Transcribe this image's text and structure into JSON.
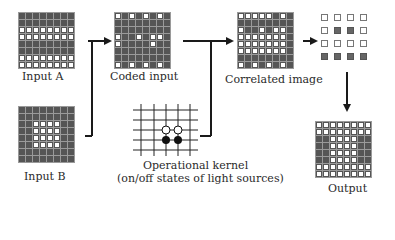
{
  "labels": {
    "input_a": "Input A",
    "input_b": "Input B",
    "coded_input": "Coded input",
    "correlated_image": "Correlated image",
    "operational_kernel_line1": "Operational kernel",
    "operational_kernel_line2": "(on/off states of light sources)",
    "output": "Output"
  },
  "grids": {
    "input_a": [
      "DDDDDDDD",
      "DDDDDDDD",
      "WWWWWWWW",
      "WWWWWWWW",
      "DDDDDDDD",
      "DDDDDDDD",
      "WWWWWWWW",
      "WWWWWWWW"
    ],
    "input_b": [
      "DDDDDDDD",
      "DDDDDDDD",
      "DDWWWWDD",
      "DDWWWWDD",
      "DDWWWWDD",
      "DDWWWWDD",
      "DDDDDDDD",
      "DDDDDDDD"
    ],
    "coded_input": [
      "WDWDWDWD",
      "DDDDDDDD",
      "DDDDDDDD",
      "WDDWDWWD",
      "WDDDDWDD",
      "DDDDDDDD",
      "DDDDDDDD",
      "WDWDWDWD"
    ],
    "correlated_image": [
      "WWWWWDWD",
      "DDDDDDDD",
      "WDDWDWWD",
      "WWWWWWWD",
      "WWWWWWWD",
      "WWWWWWWD",
      "DDDDDDDD",
      "WDWDWDWD"
    ],
    "subsampled": [
      "WWWW",
      "WDDW",
      "WWWW",
      "DDDD"
    ],
    "output": [
      "WWWWWWWW",
      "WWWWWWWW",
      "DDWWWWDD",
      "DDWWWWDD",
      "DDWWWWDD",
      "DDWWWWDD",
      "WWWWWWWW",
      "WWWWWWWW"
    ]
  },
  "kernel": {
    "open_circles": [
      [
        166,
        130
      ],
      [
        178,
        130
      ]
    ],
    "filled_circles": [
      [
        166,
        140
      ],
      [
        178,
        140
      ]
    ]
  },
  "colors": {
    "dark_cell": "#555555",
    "light_cell": "#ffffff",
    "line": "#1a1a1a"
  }
}
